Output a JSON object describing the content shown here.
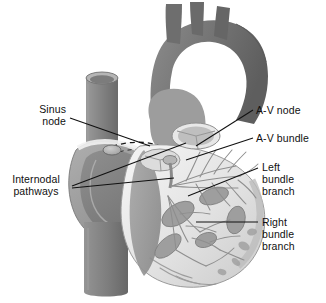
{
  "figure": {
    "background_color": "#ffffff",
    "line_color": "#101010",
    "palette": {
      "dark_muscle": "#6f6f6f",
      "mid_muscle": "#8d8d8d",
      "light_muscle": "#a8a8a8",
      "pale_tissue": "#cfcfcf",
      "very_pale": "#e6e6e6",
      "white_tissue": "#f4f4f4",
      "outline": "#7a7a7a"
    }
  },
  "labels": [
    {
      "id": "sinus-node",
      "text": "Sinus\nnode",
      "align": "right",
      "x": 10,
      "y": 103,
      "width": 56,
      "leader": [
        [
          70,
          118
        ],
        [
          150,
          146
        ]
      ]
    },
    {
      "id": "internodal-pathways",
      "text": "Internodal\npathways",
      "align": "center",
      "x": 2,
      "y": 173,
      "width": 68,
      "leader": [
        [
          72,
          186
        ],
        [
          186,
          143
        ]
      ],
      "leader2": [
        [
          72,
          188
        ],
        [
          174,
          178
        ]
      ]
    },
    {
      "id": "av-node",
      "text": "A-V node",
      "align": "left",
      "x": 256,
      "y": 104,
      "width": 66,
      "leader": [
        [
          253,
          110
        ],
        [
          196,
          146
        ]
      ]
    },
    {
      "id": "av-bundle",
      "text": "A-V bundle",
      "align": "left",
      "x": 256,
      "y": 132,
      "width": 70,
      "leader": [
        [
          253,
          138
        ],
        [
          186,
          160
        ]
      ]
    },
    {
      "id": "left-bundle-branch",
      "text": "Left\nbundle\nbranch",
      "align": "left",
      "x": 262,
      "y": 161,
      "width": 62,
      "leader": [
        [
          258,
          168
        ],
        [
          188,
          196
        ]
      ]
    },
    {
      "id": "right-bundle-branch",
      "text": "Right\nbundle\nbranch",
      "align": "left",
      "x": 262,
      "y": 216,
      "width": 62,
      "leader": [
        [
          258,
          222
        ],
        [
          196,
          222
        ]
      ]
    }
  ],
  "anatomy": {
    "structures": [
      "aortic-arch",
      "brachiocephalic-trunk",
      "left-common-carotid-artery",
      "left-subclavian-artery",
      "superior-vena-cava",
      "inferior-vena-cava",
      "right-atrium",
      "left-atrium",
      "right-ventricle",
      "left-ventricle",
      "interventricular-septum",
      "aortic-valve-cusps",
      "papillary-muscles",
      "purkinje-fiber-network",
      "sinoatrial-node",
      "atrioventricular-node",
      "bundle-of-his",
      "left-bundle-branch-fibers",
      "right-bundle-branch-fibers",
      "internodal-tract-dashed"
    ]
  }
}
